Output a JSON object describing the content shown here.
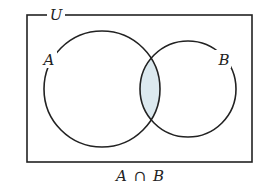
{
  "diagram": {
    "type": "venn",
    "universe_label": "U",
    "sets": [
      {
        "name": "A",
        "label": "A"
      },
      {
        "name": "B",
        "label": "B"
      }
    ],
    "shaded_region": "A ∩ B",
    "caption": {
      "left": "A",
      "operator": "∩",
      "right": "B"
    },
    "colors": {
      "stroke": "#222222",
      "shade": "#dce9ef",
      "background": "#ffffff"
    }
  }
}
